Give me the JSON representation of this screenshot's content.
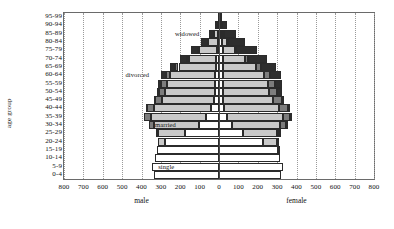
{
  "chart_data": {
    "type": "bar",
    "subtype": "population-pyramid-stacked",
    "title": "",
    "xlabel": "",
    "ylabel": "age group",
    "xlim": [
      -800,
      800
    ],
    "xticks": [
      800,
      700,
      600,
      500,
      400,
      300,
      200,
      100,
      0,
      100,
      200,
      300,
      400,
      500,
      600,
      700,
      800
    ],
    "grid": "vertical-dotted",
    "legend_position": "in-plot-annotations",
    "side_labels": {
      "left": "male",
      "right": "female"
    },
    "categories": [
      "95-99",
      "90-94",
      "85-89",
      "80-84",
      "75-79",
      "70-74",
      "65-69",
      "60-64",
      "55-59",
      "50-54",
      "45-49",
      "40-44",
      "35-39",
      "30-34",
      "25-29",
      "20-24",
      "15-19",
      "10-14",
      "5-9",
      "0-4"
    ],
    "status_series": [
      "single",
      "married",
      "divorced",
      "widowed"
    ],
    "status_colors": {
      "single": "#ffffff",
      "married": "#c9c9c9",
      "divorced": "#7d7d7d",
      "widowed": "#2e2e2e"
    },
    "annotations": [
      {
        "text": "widowed",
        "age_group": "85-89",
        "side": "male"
      },
      {
        "text": "divorced",
        "age_group": "60-64",
        "side": "male"
      },
      {
        "text": "married",
        "age_group": "30-34",
        "side": "male"
      },
      {
        "text": "single",
        "age_group": "5-9",
        "side": "male"
      }
    ],
    "male": {
      "95-99": {
        "single": 1,
        "married": 1,
        "divorced": 0,
        "widowed": 4
      },
      "90-94": {
        "single": 2,
        "married": 6,
        "divorced": 1,
        "widowed": 13
      },
      "85-89": {
        "single": 4,
        "married": 20,
        "divorced": 2,
        "widowed": 26
      },
      "80-84": {
        "single": 7,
        "married": 48,
        "divorced": 4,
        "widowed": 33
      },
      "75-79": {
        "single": 10,
        "married": 92,
        "divorced": 7,
        "widowed": 38
      },
      "70-74": {
        "single": 13,
        "married": 140,
        "divorced": 11,
        "widowed": 36
      },
      "65-69": {
        "single": 16,
        "married": 193,
        "divorced": 17,
        "widowed": 29
      },
      "60-64": {
        "single": 19,
        "married": 233,
        "divorced": 24,
        "widowed": 21
      },
      "55-59": {
        "single": 20,
        "married": 250,
        "divorced": 29,
        "widowed": 14
      },
      "50-54": {
        "single": 22,
        "married": 255,
        "divorced": 33,
        "widowed": 9
      },
      "45-49": {
        "single": 26,
        "married": 268,
        "divorced": 36,
        "widowed": 6
      },
      "40-44": {
        "single": 42,
        "married": 292,
        "divorced": 38,
        "widowed": 4
      },
      "35-39": {
        "single": 66,
        "married": 286,
        "divorced": 33,
        "widowed": 2
      },
      "30-34": {
        "single": 105,
        "married": 232,
        "divorced": 23,
        "widowed": 1
      },
      "25-29": {
        "single": 178,
        "married": 138,
        "divorced": 10,
        "widowed": 0
      },
      "20-24": {
        "single": 277,
        "married": 36,
        "divorced": 2,
        "widowed": 0
      },
      "15-19": {
        "single": 318,
        "married": 2,
        "divorced": 0,
        "widowed": 0
      },
      "10-14": {
        "single": 330,
        "married": 0,
        "divorced": 0,
        "widowed": 0
      },
      "5-9": {
        "single": 345,
        "married": 0,
        "divorced": 0,
        "widowed": 0
      },
      "0-4": {
        "single": 337,
        "married": 0,
        "divorced": 0,
        "widowed": 0
      }
    },
    "female": {
      "95-99": {
        "single": 2,
        "married": 1,
        "divorced": 0,
        "widowed": 9
      },
      "90-94": {
        "single": 5,
        "married": 4,
        "divorced": 1,
        "widowed": 31
      },
      "85-89": {
        "single": 10,
        "married": 12,
        "divorced": 2,
        "widowed": 62
      },
      "80-84": {
        "single": 15,
        "married": 28,
        "divorced": 5,
        "widowed": 88
      },
      "75-79": {
        "single": 19,
        "married": 62,
        "divorced": 9,
        "widowed": 105
      },
      "70-74": {
        "single": 21,
        "married": 112,
        "divorced": 15,
        "widowed": 100
      },
      "65-69": {
        "single": 22,
        "married": 170,
        "divorced": 23,
        "widowed": 79
      },
      "60-64": {
        "single": 21,
        "married": 212,
        "divorced": 31,
        "widowed": 55
      },
      "55-59": {
        "single": 20,
        "married": 232,
        "divorced": 37,
        "widowed": 36
      },
      "50-54": {
        "single": 19,
        "married": 240,
        "divorced": 42,
        "widowed": 23
      },
      "45-49": {
        "single": 20,
        "married": 258,
        "divorced": 45,
        "widowed": 14
      },
      "40-44": {
        "single": 26,
        "married": 286,
        "divorced": 46,
        "widowed": 8
      },
      "35-39": {
        "single": 40,
        "married": 288,
        "divorced": 40,
        "widowed": 5
      },
      "30-34": {
        "single": 67,
        "married": 249,
        "divorced": 28,
        "widowed": 3
      },
      "25-29": {
        "single": 123,
        "married": 175,
        "divorced": 14,
        "widowed": 1
      },
      "20-24": {
        "single": 227,
        "married": 71,
        "divorced": 4,
        "widowed": 0
      },
      "15-19": {
        "single": 302,
        "married": 7,
        "divorced": 0,
        "widowed": 0
      },
      "10-14": {
        "single": 314,
        "married": 0,
        "divorced": 0,
        "widowed": 0
      },
      "5-9": {
        "single": 328,
        "married": 0,
        "divorced": 0,
        "widowed": 0
      },
      "0-4": {
        "single": 320,
        "married": 0,
        "divorced": 0,
        "widowed": 0
      }
    }
  }
}
